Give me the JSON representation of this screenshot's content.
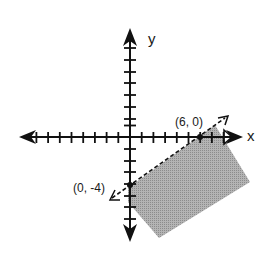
{
  "diagram": {
    "type": "linear-inequality-graph",
    "axes": {
      "x_label": "x",
      "y_label": "y",
      "x_ticks": [
        -9,
        -8,
        -7,
        -6,
        -5,
        -4,
        -3,
        -2,
        -1,
        1,
        2,
        3,
        4,
        5,
        6,
        7,
        8
      ],
      "y_ticks": [
        -1,
        -2,
        -3,
        -4,
        -5,
        -6,
        -7,
        -8,
        -9,
        1,
        2,
        3,
        4,
        5,
        6,
        7,
        8,
        9
      ]
    },
    "boundary_line": {
      "style": "dashed",
      "passes_through": [
        [
          0,
          -4
        ],
        [
          6,
          0
        ]
      ],
      "equation": "y = (2/3)x - 4"
    },
    "points": [
      {
        "label": "(6, 0)",
        "x": 6,
        "y": 0
      },
      {
        "label": "(0, -4)",
        "x": 0,
        "y": -4
      }
    ],
    "shaded_region": "below the dashed line (lower-right side)",
    "colors": {
      "axis": "#111111",
      "shade": "#a9a9a9",
      "background": "#ffffff"
    }
  }
}
